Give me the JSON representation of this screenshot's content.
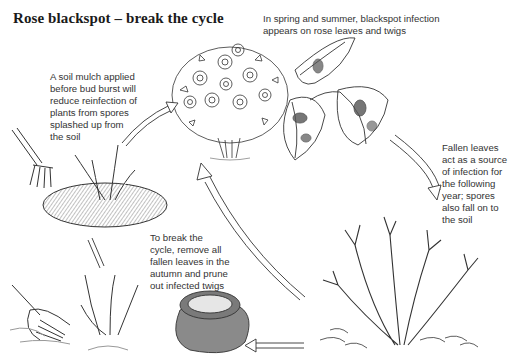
{
  "title": "Rose blackspot – break the cycle",
  "captions": {
    "spring": "In spring and summer, blackspot infection\nappears on rose leaves and twigs",
    "mulch": "A soil mulch applied\nbefore bud burst will\nreduce reinfection of\nplants from spores\nsplashed up from\nthe soil",
    "fallen": "Fallen leaves\nact as a source\nof infection for\nthe following\nyear; spores\nalso fall on to\nthe soil",
    "break": "To break the\ncycle, remove all\nfallen leaves in the\nautumn and prune\nout infected twigs"
  },
  "stages": [
    {
      "name": "flowering-rose-bush",
      "label": "Rose bush in leaf and flower"
    },
    {
      "name": "infected-leaves",
      "label": "Leaves with blackspot"
    },
    {
      "name": "bare-rose-bush",
      "label": "Bare rose with fallen leaves"
    },
    {
      "name": "leaf-sack",
      "label": "Sack of collected leaves"
    },
    {
      "name": "pruned-rose",
      "label": "Pruned rose with rake"
    },
    {
      "name": "mulched-rose",
      "label": "Mulched rose with fork"
    }
  ],
  "colors": {
    "line": "#333333",
    "sack": "#8a8a8a",
    "mulch": "#7a7a7a",
    "blotch": "#555555"
  }
}
